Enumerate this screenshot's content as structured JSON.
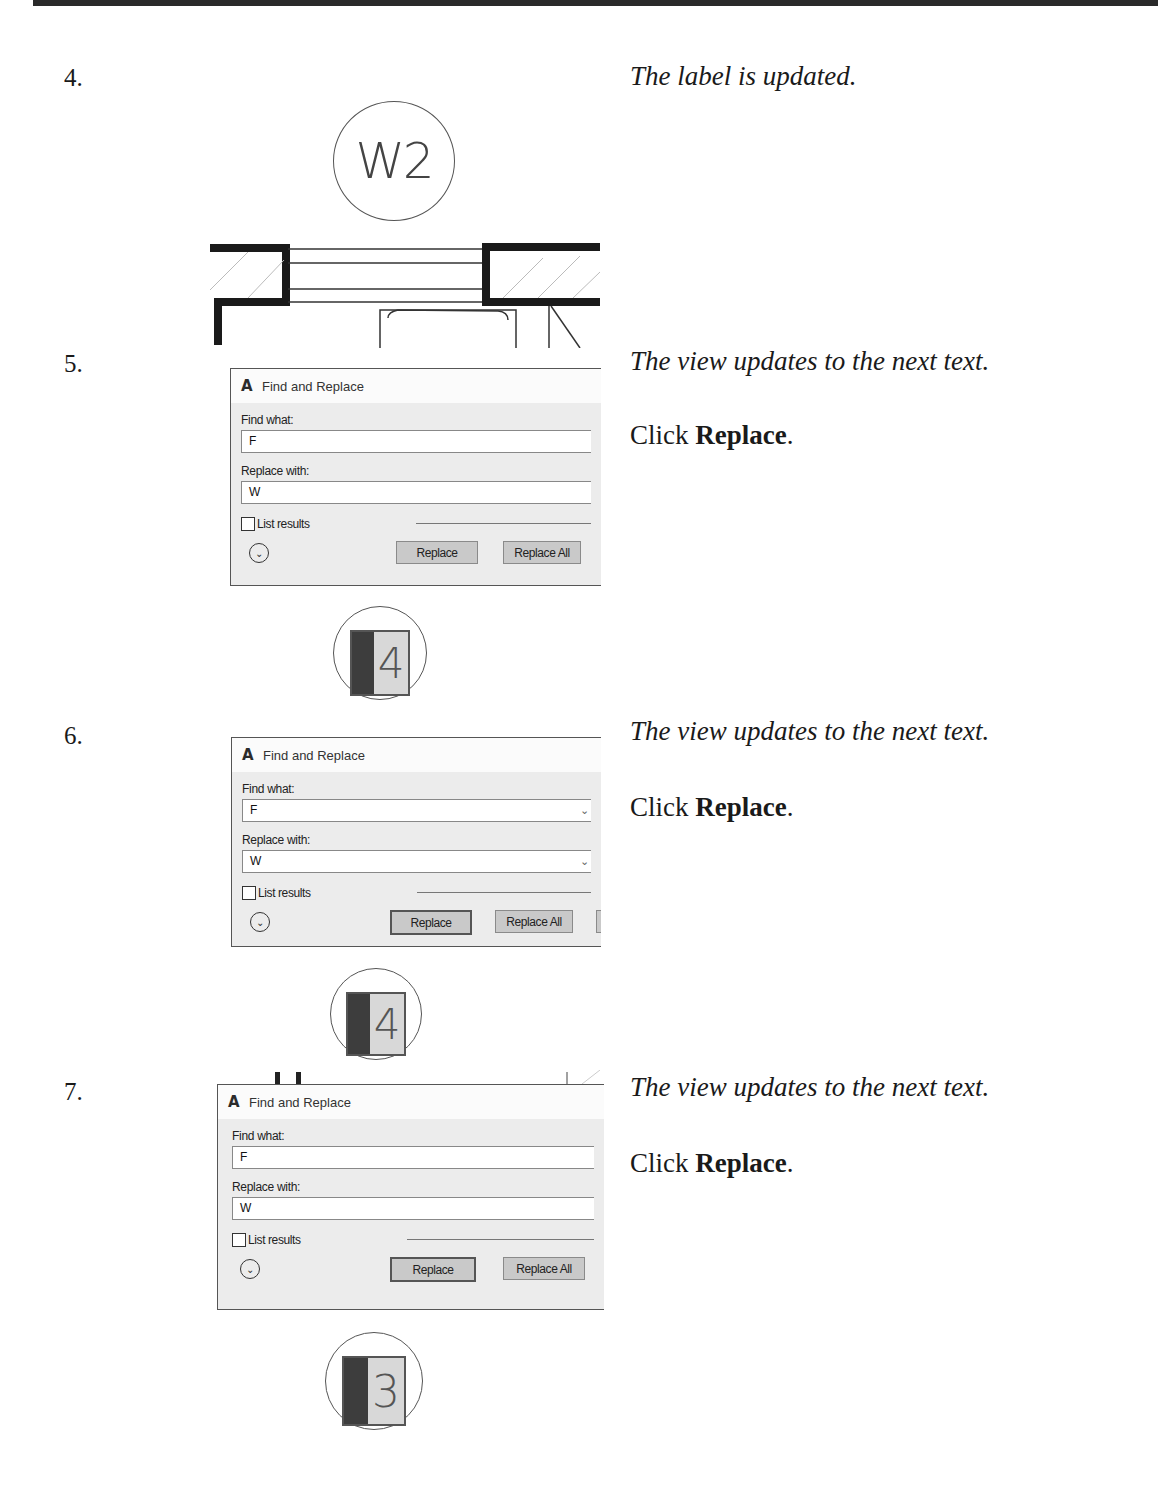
{
  "page": {
    "steps": [
      {
        "number": "4.",
        "description": "The label is updated.",
        "figure": {
          "callout_label": "W2",
          "type": "window-plan-drawing"
        }
      },
      {
        "number": "5.",
        "description": "The view updates to the next text.",
        "instruction_prefix": "Click ",
        "instruction_bold": "Replace",
        "instruction_suffix": ".",
        "dialog": {
          "title": "Find and Replace",
          "find_label": "Find what:",
          "find_value": "F",
          "replace_label": "Replace with:",
          "replace_value": "W",
          "list_results_label": "List results",
          "list_results_checked": false,
          "replace_button": "Replace",
          "replace_all_button": "Replace All"
        },
        "tag_value": "4"
      },
      {
        "number": "6.",
        "description": "The view updates to the next text.",
        "instruction_prefix": "Click ",
        "instruction_bold": "Replace",
        "instruction_suffix": ".",
        "dialog": {
          "title": "Find and Replace",
          "find_label": "Find what:",
          "find_value": "F",
          "replace_label": "Replace with:",
          "replace_value": "W",
          "list_results_label": "List results",
          "list_results_checked": false,
          "replace_button": "Replace",
          "replace_all_button": "Replace All"
        },
        "tag_value": "4"
      },
      {
        "number": "7.",
        "description": "The view updates to the next text.",
        "instruction_prefix": "Click ",
        "instruction_bold": "Replace",
        "instruction_suffix": ".",
        "dialog": {
          "title": "Find and Replace",
          "find_label": "Find what:",
          "find_value": "F",
          "replace_label": "Replace with:",
          "replace_value": "W",
          "list_results_label": "List results",
          "list_results_checked": false,
          "replace_button": "Replace",
          "replace_all_button": "Replace All"
        },
        "tag_value": "3"
      }
    ]
  },
  "icons": {
    "app": "A",
    "expand": "⌄",
    "dropdown": "⌄"
  },
  "colors": {
    "rule": "#2a2a2a",
    "dialog_bg": "#ececec",
    "button_bg": "#c9c9c9",
    "tag_dark": "#3d3d3d",
    "tag_light": "#d8d8d8"
  }
}
